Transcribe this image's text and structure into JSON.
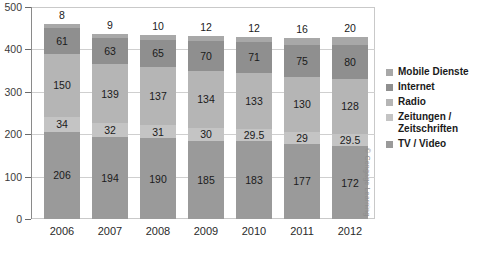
{
  "chart_data": {
    "type": "bar",
    "subtype": "stacked-bar",
    "title": "",
    "xlabel": "",
    "ylabel": "",
    "ylim": [
      0,
      500
    ],
    "yticks": [
      0,
      100,
      200,
      300,
      400,
      500
    ],
    "grid": true,
    "legend_position": "right",
    "categories": [
      "2006",
      "2007",
      "2008",
      "2009",
      "2010",
      "2011",
      "2012"
    ],
    "series": [
      {
        "name": "TV / Video",
        "color": "#9a9a9a",
        "values": [
          206,
          194,
          190,
          185,
          183,
          177,
          172
        ],
        "labels": [
          "206",
          "194",
          "190",
          "185",
          "183",
          "177",
          "172"
        ]
      },
      {
        "name": "Zeitungen /\nZeitschriften",
        "color": "#c4c4c4",
        "values": [
          34,
          32,
          31,
          30,
          29.5,
          29,
          29.5
        ],
        "labels": [
          "34",
          "32",
          "31",
          "30",
          "29.5",
          "29",
          "29.5"
        ]
      },
      {
        "name": "Radio",
        "color": "#b5b5b5",
        "values": [
          150,
          139,
          137,
          134,
          133,
          130,
          128
        ],
        "labels": [
          "150",
          "139",
          "137",
          "134",
          "133",
          "130",
          "128"
        ]
      },
      {
        "name": "Internet",
        "color": "#8f8f8f",
        "values": [
          61,
          63,
          65,
          70,
          71,
          75,
          80
        ],
        "labels": [
          "61",
          "63",
          "65",
          "70",
          "71",
          "75",
          "80"
        ]
      },
      {
        "name": "Mobile Dienste",
        "color": "#a8a8a8",
        "values": [
          8,
          9,
          10,
          12,
          12,
          16,
          20
        ],
        "labels": [
          "8",
          "9",
          "10",
          "12",
          "12",
          "16",
          "20"
        ]
      }
    ],
    "totals": [
      459,
      437,
      433,
      431,
      428.5,
      427,
      429.5
    ]
  },
  "legend": {
    "items": [
      {
        "label": "Mobile Dienste",
        "color": "#a8a8a8"
      },
      {
        "label": "Internet",
        "color": "#8f8f8f"
      },
      {
        "label": "Radio",
        "color": "#b5b5b5"
      },
      {
        "label": "Zeitungen /\nZeitschriften",
        "color": "#c4c4c4"
      },
      {
        "label": "TV / Video",
        "color": "#9a9a9a"
      }
    ]
  },
  "attribution": {
    "text": "© Cengage Learning"
  },
  "title_sliver": {
    "text": ""
  }
}
